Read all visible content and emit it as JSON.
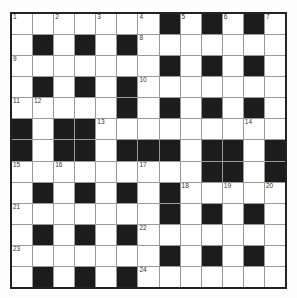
{
  "puzzle": {
    "type": "crossword",
    "size": 13,
    "rows": [
      "WWWWWWWBWBWBW",
      "WBWBWBWWWWWWW",
      "WWWWWWWBWBWBW",
      "WBWBWBWWWWWWW",
      "WWWWWBWBWBWBW",
      "BWBBWWWWWWWWW",
      "BWBBWBBBWBBWB",
      "WWWWWWWWWBBWB",
      "WBWBWBWBWWWWW",
      "WWWWWWWBWBWBW",
      "WBWBWBWWWWWWW",
      "WWWWWWWBWBWBW",
      "WBWBWBWWWWWWW"
    ],
    "numbers": [
      {
        "n": "1",
        "r": 0,
        "c": 0
      },
      {
        "n": "2",
        "r": 0,
        "c": 2
      },
      {
        "n": "3",
        "r": 0,
        "c": 4
      },
      {
        "n": "4",
        "r": 0,
        "c": 6
      },
      {
        "n": "5",
        "r": 0,
        "c": 8
      },
      {
        "n": "6",
        "r": 0,
        "c": 10
      },
      {
        "n": "7",
        "r": 0,
        "c": 12
      },
      {
        "n": "8",
        "r": 1,
        "c": 6
      },
      {
        "n": "9",
        "r": 2,
        "c": 0
      },
      {
        "n": "10",
        "r": 3,
        "c": 6
      },
      {
        "n": "11",
        "r": 4,
        "c": 0
      },
      {
        "n": "12",
        "r": 4,
        "c": 1
      },
      {
        "n": "13",
        "r": 5,
        "c": 4
      },
      {
        "n": "14",
        "r": 5,
        "c": 11
      },
      {
        "n": "15",
        "r": 7,
        "c": 0
      },
      {
        "n": "16",
        "r": 7,
        "c": 2
      },
      {
        "n": "17",
        "r": 7,
        "c": 6
      },
      {
        "n": "18",
        "r": 8,
        "c": 8
      },
      {
        "n": "19",
        "r": 8,
        "c": 10
      },
      {
        "n": "20",
        "r": 8,
        "c": 12
      },
      {
        "n": "21",
        "r": 9,
        "c": 0
      },
      {
        "n": "22",
        "r": 10,
        "c": 6
      },
      {
        "n": "23",
        "r": 11,
        "c": 0
      },
      {
        "n": "24",
        "r": 12,
        "c": 6
      }
    ]
  }
}
